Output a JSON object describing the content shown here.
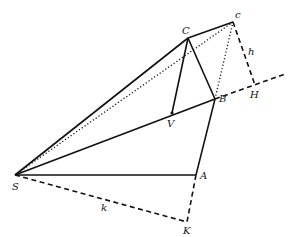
{
  "diagram": {
    "type": "geometry",
    "points": {
      "S": {
        "label": "S",
        "x": 15,
        "y": 175
      },
      "A": {
        "label": "A",
        "x": 196,
        "y": 175
      },
      "K": {
        "label": "K",
        "x": 187,
        "y": 222
      },
      "B": {
        "label": "B",
        "x": 215,
        "y": 99
      },
      "C": {
        "label": "C",
        "x": 188,
        "y": 38
      },
      "c": {
        "label": "c",
        "x": 233,
        "y": 22
      },
      "H": {
        "label": "H",
        "x": 255,
        "y": 85
      },
      "V": {
        "label": "V",
        "x": 172,
        "y": 113
      }
    },
    "segment_labels": {
      "h": "h",
      "k": "k"
    },
    "segments": [
      {
        "from": "S",
        "to": "A",
        "style": "solid"
      },
      {
        "from": "S",
        "to": "B",
        "style": "solid"
      },
      {
        "from": "S",
        "to": "C",
        "style": "solid"
      },
      {
        "from": "A",
        "to": "B",
        "style": "solid"
      },
      {
        "from": "B",
        "to": "C",
        "style": "solid"
      },
      {
        "from": "C",
        "to": "c",
        "style": "solid"
      },
      {
        "from": "C",
        "to": "V",
        "style": "solid"
      },
      {
        "from": "S",
        "to": "c",
        "style": "dotted"
      },
      {
        "from": "B",
        "to": "c",
        "style": "dotted"
      },
      {
        "from": "c",
        "to": "H",
        "style": "dashed",
        "label": "h"
      },
      {
        "from": "B",
        "to": "H",
        "style": "dashed",
        "extends_beyond": true
      },
      {
        "from": "S",
        "to": "K",
        "style": "dashed",
        "label": "k"
      },
      {
        "from": "A",
        "to": "K",
        "style": "dashed"
      }
    ]
  }
}
